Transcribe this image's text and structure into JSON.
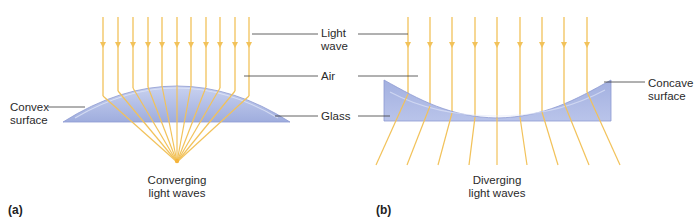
{
  "panel_a": {
    "tag": "(a)",
    "left_label_line1": "Convex",
    "left_label_line2": "surface",
    "bottom_label_line1": "Converging",
    "bottom_label_line2": "light waves"
  },
  "panel_b": {
    "tag": "(b)",
    "right_label_line1": "Concave",
    "right_label_line2": "surface",
    "bottom_label_line1": "Diverging",
    "bottom_label_line2": "light waves"
  },
  "shared_labels": {
    "light_wave_line1": "Light",
    "light_wave_line2": "wave",
    "air": "Air",
    "glass": "Glass"
  },
  "colors": {
    "ray": "#f2c25a",
    "lens_fill": "#a9b6e3",
    "lens_edge": "#7f8fcf",
    "leader_line": "#3a3a3a"
  }
}
